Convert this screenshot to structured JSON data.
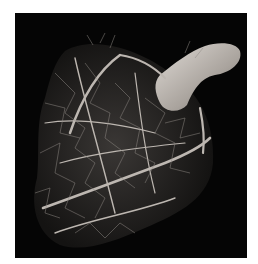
{
  "image": {
    "subject": "coronary vascular cast of a heart",
    "background_color": "#ffffff",
    "frame_color": "#050505",
    "vessel_color": "#b9b3ad",
    "aorta_color": "#c8c2bc"
  }
}
